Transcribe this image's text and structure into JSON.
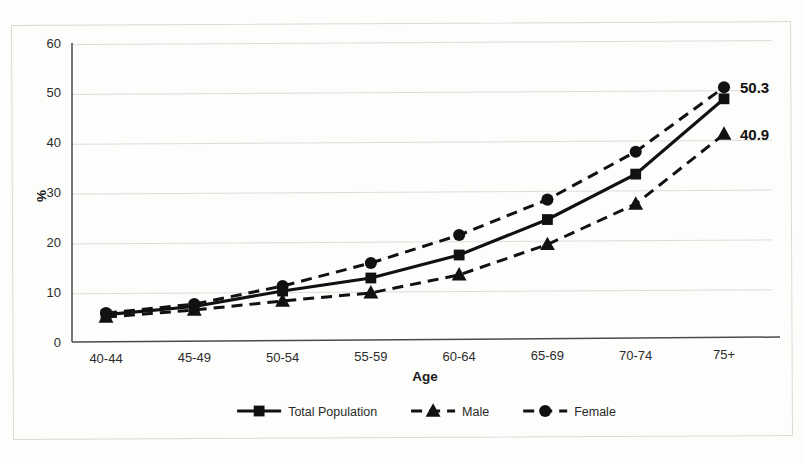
{
  "chart_data": {
    "type": "line",
    "title": "",
    "xlabel": "Age",
    "ylabel": "%",
    "categories": [
      "40-44",
      "45-49",
      "50-54",
      "55-59",
      "60-64",
      "65-69",
      "70-74",
      "75+"
    ],
    "ylim": [
      0,
      60
    ],
    "yticks": [
      0,
      10,
      20,
      30,
      40,
      50,
      60
    ],
    "grid": true,
    "legend_position": "bottom",
    "series": [
      {
        "name": "Total Population",
        "marker": "square",
        "linestyle": "solid",
        "color": "#111111",
        "values": [
          5.5,
          7.0,
          10.0,
          12.5,
          17.0,
          24.0,
          33.0,
          48.0
        ]
      },
      {
        "name": "Male",
        "marker": "triangle",
        "linestyle": "dashed",
        "color": "#111111",
        "values": [
          5.0,
          6.3,
          8.0,
          9.5,
          13.0,
          19.0,
          27.0,
          40.9
        ]
      },
      {
        "name": "Female",
        "marker": "circle",
        "linestyle": "dashed",
        "color": "#111111",
        "values": [
          5.8,
          7.5,
          11.0,
          15.5,
          21.0,
          28.0,
          37.5,
          50.3
        ]
      }
    ],
    "annotations": [
      {
        "text": "50.3",
        "series": "Female",
        "category": "75+",
        "value": 50.3
      },
      {
        "text": "40.9",
        "series": "Male",
        "category": "75+",
        "value": 40.9
      }
    ]
  },
  "axes": {
    "y_label": "%",
    "x_label": "Age",
    "y_tick_labels": [
      "0",
      "10",
      "20",
      "30",
      "40",
      "50",
      "60"
    ],
    "x_tick_labels": [
      "40-44",
      "45-49",
      "50-54",
      "55-59",
      "60-64",
      "65-69",
      "70-74",
      "75+"
    ]
  },
  "legend": {
    "items": [
      {
        "label": "Total Population",
        "marker": "square-marker",
        "dashed": false
      },
      {
        "label": "Male",
        "marker": "triangle-marker",
        "dashed": true
      },
      {
        "label": "Female",
        "marker": "circle-marker",
        "dashed": true
      }
    ]
  },
  "data_labels": {
    "female_last": "50.3",
    "male_last": "40.9"
  },
  "scan": {
    "bleed_text": ""
  }
}
